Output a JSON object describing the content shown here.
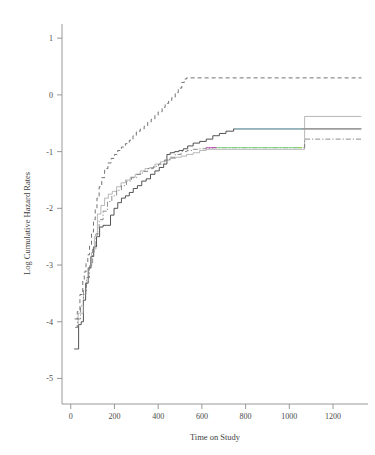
{
  "chart_data": {
    "type": "line",
    "title": "",
    "xlabel": "Time on Study",
    "ylabel": "Log Cumulative Hazard Rates",
    "xlim": [
      -40,
      1360
    ],
    "ylim": [
      -5.45,
      1.25
    ],
    "xticks": [
      0,
      200,
      400,
      600,
      800,
      1000,
      1200
    ],
    "yticks": [
      1,
      0,
      -1,
      -2,
      -3,
      -4,
      -5
    ],
    "xtick_labels": [
      "0",
      "200",
      "400",
      "600",
      "800",
      "1000",
      "1200"
    ],
    "ytick_labels": [
      "1",
      "0",
      "-1",
      "-2",
      "-3",
      "-4",
      "-5"
    ],
    "grid": false,
    "legend": "none",
    "step_type": "post",
    "series": [
      {
        "name": "group-1-dashed",
        "style": "dashed",
        "color": "#5a5a5a",
        "x": [
          18,
          30,
          42,
          55,
          62,
          70,
          78,
          86,
          95,
          104,
          112,
          120,
          130,
          142,
          155,
          170,
          185,
          200,
          215,
          232,
          250,
          268,
          285,
          300,
          318,
          336,
          352,
          368,
          385,
          400,
          418,
          432,
          448,
          462,
          478,
          492,
          508,
          520,
          530,
          1330
        ],
        "y": [
          -3.95,
          -3.82,
          -3.52,
          -3.28,
          -3.12,
          -2.96,
          -2.82,
          -2.64,
          -2.42,
          -2.2,
          -2.0,
          -1.82,
          -1.62,
          -1.46,
          -1.3,
          -1.2,
          -1.12,
          -1.05,
          -0.98,
          -0.92,
          -0.86,
          -0.8,
          -0.72,
          -0.64,
          -0.6,
          -0.55,
          -0.48,
          -0.43,
          -0.36,
          -0.3,
          -0.22,
          -0.15,
          -0.1,
          -0.05,
          0.04,
          0.12,
          0.22,
          0.28,
          0.3,
          0.3
        ]
      },
      {
        "name": "group-2-solid",
        "style": "solid",
        "color": "#4a4a4a",
        "x": [
          16,
          26,
          36,
          48,
          58,
          68,
          80,
          92,
          105,
          118,
          132,
          148,
          165,
          182,
          198,
          215,
          232,
          250,
          268,
          286,
          305,
          325,
          345,
          365,
          385,
          405,
          425,
          440,
          455,
          475,
          495,
          515,
          535,
          560,
          590,
          620,
          650,
          680,
          710,
          745,
          1330
        ],
        "y": [
          -4.48,
          -4.48,
          -4.05,
          -4.0,
          -3.62,
          -3.32,
          -3.05,
          -2.85,
          -2.68,
          -2.5,
          -2.33,
          -2.3,
          -2.3,
          -2.12,
          -2.0,
          -1.9,
          -1.82,
          -1.78,
          -1.72,
          -1.65,
          -1.6,
          -1.52,
          -1.48,
          -1.4,
          -1.34,
          -1.28,
          -1.22,
          -1.05,
          -1.02,
          -1.0,
          -0.98,
          -0.95,
          -0.9,
          -0.85,
          -0.82,
          -0.78,
          -0.72,
          -0.68,
          -0.64,
          -0.6,
          -0.6
        ]
      },
      {
        "name": "group-3-thin-solid",
        "style": "solid-thin",
        "color": "#9a9a9a",
        "x": [
          24,
          34,
          46,
          58,
          70,
          82,
          95,
          108,
          122,
          138,
          155,
          172,
          190,
          210,
          230,
          250,
          272,
          295,
          318,
          340,
          362,
          385,
          410,
          432,
          455,
          480,
          505,
          530,
          560,
          590,
          620,
          1062,
          1070,
          1330
        ],
        "y": [
          -4.08,
          -3.85,
          -3.85,
          -3.52,
          -3.3,
          -3.05,
          -2.78,
          -2.5,
          -2.1,
          -1.95,
          -1.82,
          -1.75,
          -1.7,
          -1.62,
          -1.55,
          -1.5,
          -1.45,
          -1.4,
          -1.34,
          -1.3,
          -1.28,
          -1.22,
          -1.18,
          -1.15,
          -1.12,
          -1.1,
          -1.08,
          -1.05,
          -1.02,
          -0.98,
          -0.96,
          -0.96,
          -0.38,
          -0.38
        ]
      },
      {
        "name": "group-4-dashdot",
        "style": "dashdot",
        "color": "#6a6a6a",
        "x": [
          20,
          32,
          45,
          58,
          72,
          86,
          100,
          115,
          130,
          148,
          168,
          188,
          210,
          232,
          255,
          278,
          302,
          328,
          352,
          378,
          402,
          428,
          452,
          478,
          505,
          532,
          560,
          590,
          618,
          650,
          1058,
          1070,
          1330
        ],
        "y": [
          -4.1,
          -3.95,
          -3.72,
          -3.45,
          -3.22,
          -3.0,
          -2.72,
          -2.45,
          -2.2,
          -2.05,
          -1.88,
          -1.78,
          -1.68,
          -1.6,
          -1.52,
          -1.46,
          -1.4,
          -1.35,
          -1.3,
          -1.26,
          -1.22,
          -1.15,
          -1.1,
          -1.05,
          -1.0,
          -0.98,
          -0.96,
          -0.95,
          -0.94,
          -0.93,
          -0.93,
          -0.78,
          -0.78
        ]
      }
    ],
    "colored_overlays": [
      {
        "name": "magenta-segment",
        "color": "#c040b0",
        "x0": 618,
        "x1": 668,
        "y": -0.93
      },
      {
        "name": "green-segment",
        "color": "#7fd47f",
        "x0": 668,
        "x1": 1058,
        "y": -0.93
      },
      {
        "name": "cyan-segment",
        "color": "#8fc9d8",
        "x0": 752,
        "x1": 1060,
        "y": -0.6
      },
      {
        "name": "lime-tick",
        "color": "#9ad24a",
        "x0": 1040,
        "x1": 1058,
        "y": -0.93
      }
    ]
  },
  "axes": {
    "y_axis_title": "Log Cumulative Hazard Rates",
    "x_axis_title": "Time on Study"
  }
}
